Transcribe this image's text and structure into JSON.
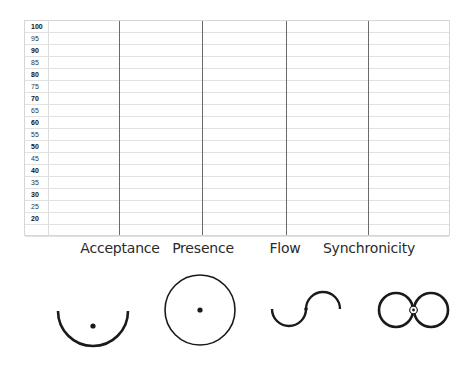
{
  "scale": {
    "rows": [
      {
        "value": "100",
        "bold": true
      },
      {
        "value": "95",
        "bold": false
      },
      {
        "value": "90",
        "bold": true
      },
      {
        "value": "85",
        "bold": false
      },
      {
        "value": "80",
        "bold": true
      },
      {
        "value": "75",
        "bold": false
      },
      {
        "value": "70",
        "bold": true
      },
      {
        "value": "65",
        "bold": false
      },
      {
        "value": "60",
        "bold": true
      },
      {
        "value": "55",
        "bold": false
      },
      {
        "value": "50",
        "bold": true
      },
      {
        "value": "45",
        "bold": false
      },
      {
        "value": "40",
        "bold": true
      },
      {
        "value": "35",
        "bold": false
      },
      {
        "value": "30",
        "bold": true
      },
      {
        "value": "25",
        "bold": false
      },
      {
        "value": "20",
        "bold": true
      },
      {
        "value": "",
        "bold": false
      }
    ]
  },
  "columns": [
    {
      "label": "Acceptance",
      "icon": "half-circle-with-dot-icon",
      "line_x": 118,
      "label_x": 120
    },
    {
      "label": "Presence",
      "icon": "circle-with-dot-icon",
      "line_x": 201,
      "label_x": 203
    },
    {
      "label": "Flow",
      "icon": "s-wave-icon",
      "line_x": 285,
      "label_x": 285
    },
    {
      "label": "Synchronicity",
      "icon": "figure-eight-icon",
      "line_x": 367,
      "label_x": 367
    }
  ],
  "colors": {
    "grid_border": "#d6d6d6",
    "grid_row": "#e2e2e2",
    "column_line": "#6a6a6a",
    "icon_stroke": "#1a1a1a",
    "label_text": "#2a2a2a"
  }
}
